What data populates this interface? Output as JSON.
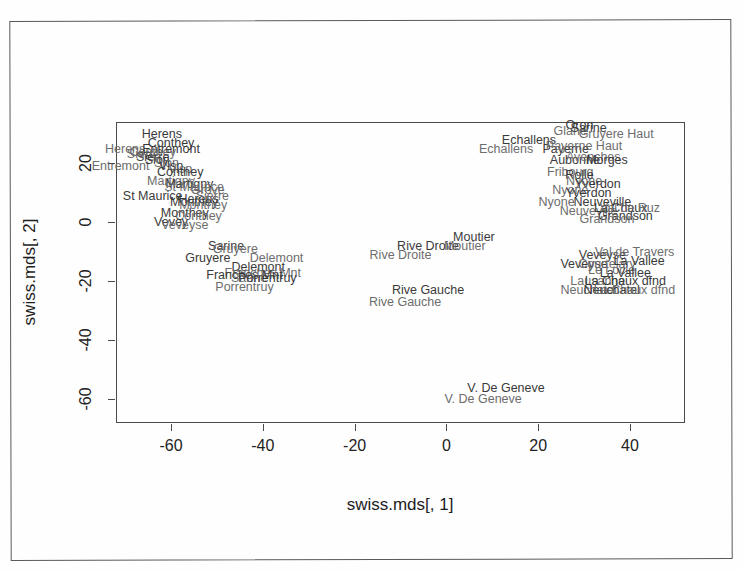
{
  "chart_data": {
    "type": "scatter",
    "title": "",
    "xlabel": "swiss.mds[, 1]",
    "ylabel": "swiss.mds[, 2]",
    "xlim": [
      -72,
      52
    ],
    "ylim": [
      -68,
      34
    ],
    "xticks": [
      -60,
      -40,
      -20,
      0,
      20,
      40
    ],
    "yticks": [
      20,
      0,
      -20,
      -40,
      -60
    ],
    "grid": false,
    "legend": null,
    "note": "Each district is drawn twice with a small offset, producing doubled overlapping text labels.",
    "points": [
      {
        "label": "Herens",
        "x": -62,
        "y": 30
      },
      {
        "label": "Herens",
        "x": -70,
        "y": 25
      },
      {
        "label": "Conthey",
        "x": -60,
        "y": 27
      },
      {
        "label": "Conthey",
        "x": -64,
        "y": 24
      },
      {
        "label": "Entremont",
        "x": -60,
        "y": 25
      },
      {
        "label": "Entremont",
        "x": -71,
        "y": 19
      },
      {
        "label": "Sierre",
        "x": -64,
        "y": 22
      },
      {
        "label": "Sierre",
        "x": -66,
        "y": 23
      },
      {
        "label": "Sion",
        "x": -63,
        "y": 21
      },
      {
        "label": "Sion",
        "x": -61,
        "y": 20
      },
      {
        "label": "Visp",
        "x": -60,
        "y": 19
      },
      {
        "label": "Visp",
        "x": -58,
        "y": 18
      },
      {
        "label": "Conthey",
        "x": -58,
        "y": 17
      },
      {
        "label": "Martigny",
        "x": -60,
        "y": 14
      },
      {
        "label": "Martigny",
        "x": -56,
        "y": 13
      },
      {
        "label": "St Maurice",
        "x": -55,
        "y": 12
      },
      {
        "label": "St Maurice",
        "x": -64,
        "y": 9
      },
      {
        "label": "Grove",
        "x": -52,
        "y": 11
      },
      {
        "label": "Monthey",
        "x": -55,
        "y": 7
      },
      {
        "label": "Monthey",
        "x": -53,
        "y": 6
      },
      {
        "label": "Herens",
        "x": -54,
        "y": 8
      },
      {
        "label": "Sierre",
        "x": -51,
        "y": 9
      },
      {
        "label": "Monthey",
        "x": -57,
        "y": 3
      },
      {
        "label": "Conthey",
        "x": -54,
        "y": 2
      },
      {
        "label": "Vevey",
        "x": -60,
        "y": 0
      },
      {
        "label": "Veveyse",
        "x": -57,
        "y": -1
      },
      {
        "label": "Sarine",
        "x": -48,
        "y": -8
      },
      {
        "label": "Gruyere",
        "x": -46,
        "y": -9
      },
      {
        "label": "Gruyere",
        "x": -52,
        "y": -12
      },
      {
        "label": "Delemont",
        "x": -37,
        "y": -12
      },
      {
        "label": "Delemont",
        "x": -41,
        "y": -15
      },
      {
        "label": "Franches Mnt",
        "x": -40,
        "y": -17
      },
      {
        "label": "Franches Mnt",
        "x": -44,
        "y": -18
      },
      {
        "label": "Sarine",
        "x": -43,
        "y": -19
      },
      {
        "label": "Porrentruy",
        "x": -39,
        "y": -19
      },
      {
        "label": "Porrentruy",
        "x": -44,
        "y": -22
      },
      {
        "label": "Rive Droite",
        "x": -4,
        "y": -8
      },
      {
        "label": "Rive Droite",
        "x": -10,
        "y": -11
      },
      {
        "label": "Moutier",
        "x": 6,
        "y": -5
      },
      {
        "label": "Moutier",
        "x": 4,
        "y": -8
      },
      {
        "label": "Rive Gauche",
        "x": -4,
        "y": -23
      },
      {
        "label": "Rive Gauche",
        "x": -9,
        "y": -27
      },
      {
        "label": "Oron",
        "x": 29,
        "y": 33
      },
      {
        "label": "Glane",
        "x": 27,
        "y": 31
      },
      {
        "label": "Sarine",
        "x": 31,
        "y": 32
      },
      {
        "label": "Gruyere Haut",
        "x": 37,
        "y": 30
      },
      {
        "label": "Echallens",
        "x": 18,
        "y": 28
      },
      {
        "label": "Echallens",
        "x": 13,
        "y": 25
      },
      {
        "label": "Payerne",
        "x": 26,
        "y": 25
      },
      {
        "label": "Payerne Haut",
        "x": 30,
        "y": 26
      },
      {
        "label": "Aubonne",
        "x": 28,
        "y": 21
      },
      {
        "label": "Avenches",
        "x": 32,
        "y": 22
      },
      {
        "label": "Morges",
        "x": 35,
        "y": 21
      },
      {
        "label": "Fribourg",
        "x": 27,
        "y": 17
      },
      {
        "label": "Rolle",
        "x": 29,
        "y": 16
      },
      {
        "label": "Nyone",
        "x": 30,
        "y": 14
      },
      {
        "label": "Yverdon",
        "x": 33,
        "y": 13
      },
      {
        "label": "Nyone",
        "x": 27,
        "y": 11
      },
      {
        "label": "Yverdon",
        "x": 31,
        "y": 10
      },
      {
        "label": "Nyone",
        "x": 24,
        "y": 7
      },
      {
        "label": "Neuveville",
        "x": 34,
        "y": 7
      },
      {
        "label": "Neuveville",
        "x": 31,
        "y": 4
      },
      {
        "label": "La Chaux",
        "x": 38,
        "y": 5
      },
      {
        "label": "Val de Ruz",
        "x": 40,
        "y": 5
      },
      {
        "label": "Grandson",
        "x": 39,
        "y": 2
      },
      {
        "label": "Grandson",
        "x": 35,
        "y": 1
      },
      {
        "label": "Veveyse",
        "x": 34,
        "y": -11
      },
      {
        "label": "Val de Travers",
        "x": 41,
        "y": -10
      },
      {
        "label": "Veveyse",
        "x": 30,
        "y": -14
      },
      {
        "label": "Courtelary",
        "x": 35,
        "y": -14
      },
      {
        "label": "La Vallee",
        "x": 42,
        "y": -13
      },
      {
        "label": "Le Locle",
        "x": 36,
        "y": -16
      },
      {
        "label": "La Vallee",
        "x": 39,
        "y": -17
      },
      {
        "label": "Lausanne",
        "x": 33,
        "y": -20
      },
      {
        "label": "La Chaux dfnd",
        "x": 39,
        "y": -20
      },
      {
        "label": "Neuchatel",
        "x": 31,
        "y": -23
      },
      {
        "label": "Neuchatel",
        "x": 36,
        "y": -23
      },
      {
        "label": "La Chaux dfnd",
        "x": 41,
        "y": -23
      },
      {
        "label": "V. De Geneve",
        "x": 13,
        "y": -56
      },
      {
        "label": "V. De Geneve",
        "x": 8,
        "y": -60
      }
    ]
  },
  "axes": {
    "xlabel": "swiss.mds[, 1]",
    "ylabel": "swiss.mds[, 2]",
    "xticklabels": [
      "-60",
      "-40",
      "-20",
      "0",
      "20",
      "40"
    ],
    "yticklabels": [
      "20",
      "0",
      "-20",
      "-40",
      "-60"
    ]
  }
}
